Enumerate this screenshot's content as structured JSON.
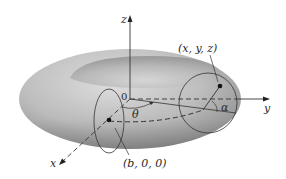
{
  "figure": {
    "axes": {
      "x_label": "x",
      "y_label": "y",
      "z_label": "z",
      "origin_label": "0"
    },
    "points": {
      "center_point_label": "(b, 0, 0)",
      "surface_point_label": "(x, y, z)"
    },
    "angles": {
      "theta_label": "θ",
      "alpha_label": "α"
    },
    "colors": {
      "torus_light": "#dcdcdc",
      "torus_mid": "#b4b4b4",
      "torus_dark": "#8c8c8c",
      "line": "#333333",
      "background": "#ffffff"
    }
  }
}
